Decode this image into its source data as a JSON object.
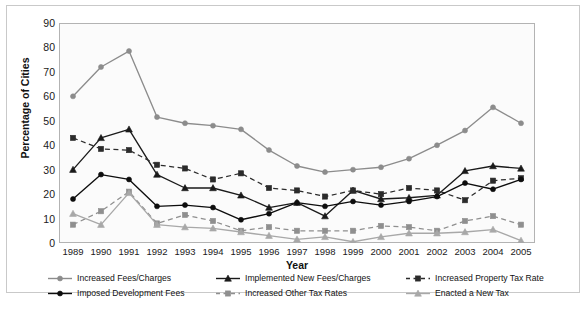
{
  "chart_data": {
    "type": "line",
    "title": "",
    "xlabel": "Year",
    "ylabel": "Percentage of Cities",
    "categories": [
      1989,
      1990,
      1991,
      1992,
      1993,
      1994,
      1995,
      1996,
      1997,
      1998,
      1999,
      2000,
      2001,
      2002,
      2003,
      2004,
      2005
    ],
    "ylim": [
      0,
      90
    ],
    "ytick_step": 10,
    "yticks": [
      90,
      80,
      70,
      60,
      50,
      40,
      30,
      20,
      10,
      0
    ],
    "grid": false,
    "legend_position": "bottom",
    "series": [
      {
        "name": "Increased Fees/Charges",
        "color": "#8c8c8c",
        "marker": "circle",
        "dash": "solid",
        "values": [
          60,
          72,
          78.5,
          51.5,
          49,
          48,
          46.5,
          38,
          31.5,
          29,
          30,
          31,
          34.5,
          40,
          46,
          55.5,
          49
        ]
      },
      {
        "name": "Implemented New Fees/Charges",
        "color": "#1a1a1a",
        "marker": "triangle",
        "dash": "solid",
        "values": [
          30,
          43,
          46.5,
          28,
          22.5,
          22.5,
          19.5,
          14.5,
          16.5,
          11,
          21.5,
          18,
          18.5,
          19.5,
          29.5,
          31.5,
          30.5
        ]
      },
      {
        "name": "Increased Property Tax Rate",
        "color": "#2b2b2b",
        "marker": "square",
        "dash": "dashed",
        "values": [
          43,
          38.5,
          38,
          32,
          30.5,
          26,
          28.5,
          22.5,
          21.5,
          19,
          21.5,
          20,
          22.5,
          21.5,
          17.5,
          25.5,
          26.5
        ]
      },
      {
        "name": "Imposed Development Fees",
        "color": "#0d0d0d",
        "marker": "circle",
        "dash": "solid",
        "values": [
          18,
          28,
          26,
          15,
          15.5,
          14.5,
          9.5,
          12,
          16.5,
          15,
          17,
          15.5,
          17,
          19,
          24.5,
          22,
          26
        ]
      },
      {
        "name": "Increased Other Tax Rates",
        "color": "#8f8f8f",
        "marker": "square",
        "dash": "dashed",
        "values": [
          7.5,
          13,
          21,
          8,
          11.5,
          9,
          5,
          6.5,
          5,
          5,
          5,
          7,
          6.5,
          5,
          9,
          11,
          7.5
        ]
      },
      {
        "name": "Enacted a New Tax",
        "color": "#a8a8a8",
        "marker": "triangle",
        "dash": "solid",
        "values": [
          12,
          7.5,
          20.5,
          7.5,
          6.5,
          6,
          4.5,
          3,
          1.5,
          2.5,
          0.5,
          2.5,
          4,
          4,
          4.5,
          5.5,
          1
        ]
      }
    ]
  },
  "legend": {
    "items": [
      {
        "label": "Increased Fees/Charges",
        "color": "#8c8c8c",
        "marker": "circle",
        "dash": "solid"
      },
      {
        "label": "Implemented New Fees/Charges",
        "color": "#1a1a1a",
        "marker": "triangle",
        "dash": "solid"
      },
      {
        "label": "Increased Property Tax Rate",
        "color": "#2b2b2b",
        "marker": "square",
        "dash": "dashed"
      },
      {
        "label": "Imposed Development Fees",
        "color": "#0d0d0d",
        "marker": "circle",
        "dash": "solid"
      },
      {
        "label": "Increased Other Tax Rates",
        "color": "#8f8f8f",
        "marker": "square",
        "dash": "dashed"
      },
      {
        "label": "Enacted a New Tax",
        "color": "#a8a8a8",
        "marker": "triangle",
        "dash": "solid"
      }
    ]
  },
  "caption": {
    "text": ""
  }
}
